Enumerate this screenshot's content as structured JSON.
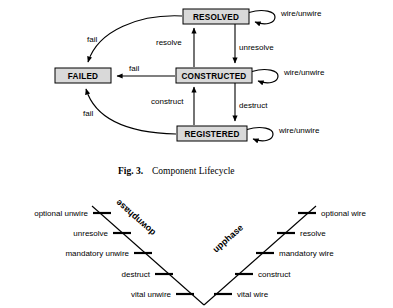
{
  "figure": {
    "caption_prefix": "Fig. 3.",
    "caption_text": "Component Lifecycle"
  },
  "statechart": {
    "states": [
      {
        "id": "resolved",
        "label": "RESOLVED",
        "x": 183,
        "y": 9,
        "w": 66,
        "h": 15
      },
      {
        "id": "failed",
        "label": "FAILED",
        "x": 55,
        "y": 68,
        "w": 56,
        "h": 15
      },
      {
        "id": "constructed",
        "label": "CONSTRUCTED",
        "x": 176,
        "y": 68,
        "w": 76,
        "h": 15
      },
      {
        "id": "registered",
        "label": "REGISTERED",
        "x": 177,
        "y": 126,
        "w": 70,
        "h": 15
      }
    ],
    "transitions": [
      {
        "id": "resolve",
        "label": "resolve"
      },
      {
        "id": "unresolve",
        "label": "unresolve"
      },
      {
        "id": "construct",
        "label": "construct"
      },
      {
        "id": "destruct",
        "label": "destruct"
      },
      {
        "id": "fail-resolved",
        "label": "fail"
      },
      {
        "id": "fail-constructed",
        "label": "fail"
      },
      {
        "id": "fail-registered",
        "label": "fail"
      }
    ],
    "self_loops": [
      {
        "id": "loop-resolved",
        "label": "wire/unwire"
      },
      {
        "id": "loop-constructed",
        "label": "wire/unwire"
      },
      {
        "id": "loop-registered",
        "label": "wire/unwire"
      }
    ],
    "colors": {
      "box_fill": "#d9d9d9",
      "stroke": "#000000",
      "background": "#ffffff"
    }
  },
  "phase_diagram": {
    "phases": [
      {
        "id": "downphase",
        "label": "downphase"
      },
      {
        "id": "upphase",
        "label": "upphase"
      }
    ],
    "down_steps": [
      {
        "id": "optional-unwire",
        "label": "optional unwire"
      },
      {
        "id": "unresolve",
        "label": "unresolve"
      },
      {
        "id": "mandatory-unwire",
        "label": "mandatory unwire"
      },
      {
        "id": "destruct",
        "label": "destruct"
      },
      {
        "id": "vital-unwire",
        "label": "vital unwire"
      }
    ],
    "up_steps": [
      {
        "id": "vital-wire",
        "label": "vital wire"
      },
      {
        "id": "construct",
        "label": "construct"
      },
      {
        "id": "mandatory-wire",
        "label": "mandatory wire"
      },
      {
        "id": "resolve",
        "label": "resolve"
      },
      {
        "id": "optional-wire",
        "label": "optional wire"
      }
    ]
  }
}
